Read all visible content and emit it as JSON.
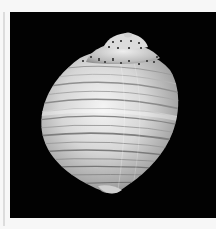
{
  "image": {
    "subject": "seashell",
    "description": "Photograph of a globose spiral sea shell with banded ridges on a black background",
    "background_color": "#020202",
    "border_color": "#f7f7f7",
    "shell_colors": {
      "highlight": "#f2f2f2",
      "mid": "#bdbdbd",
      "shadow": "#6e6e6e",
      "spots": "#4a4a4a"
    }
  }
}
